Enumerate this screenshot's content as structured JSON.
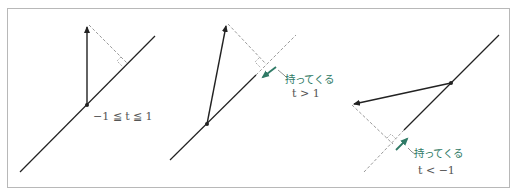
{
  "colors": {
    "line": "#222222",
    "dashed": "#9a9a9a",
    "accent": "#2f7a66",
    "label": "#555555",
    "frame": "#b8b8b8"
  },
  "panels": [
    {
      "id": "case-inside",
      "condition_label": "−1 ≦ t ≦ 1",
      "note_label": null
    },
    {
      "id": "case-greater",
      "condition_label": "t > 1",
      "note_label": "持ってくる"
    },
    {
      "id": "case-less",
      "condition_label": "t < −1",
      "note_label": "持ってくる"
    }
  ]
}
